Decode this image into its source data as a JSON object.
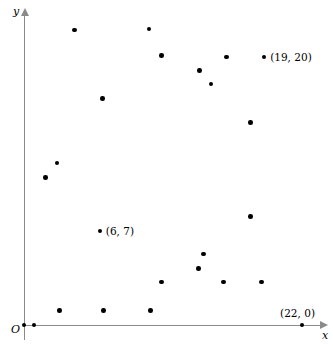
{
  "chart_data": {
    "type": "scatter",
    "title": "",
    "xlabel": "x",
    "ylabel": "y",
    "origin_label": "O",
    "grid": false,
    "legend": "none",
    "xlim": [
      0,
      23.6
    ],
    "ylim": [
      0,
      23.2
    ],
    "marker_color": "#000000",
    "axis_color": "#8a8a8a",
    "points": [
      {
        "x": 0,
        "y": 0,
        "label": ""
      },
      {
        "x": 0.8,
        "y": 0,
        "label": ""
      },
      {
        "x": 2.8,
        "y": 1.1,
        "label": ""
      },
      {
        "x": 2.6,
        "y": 12.1,
        "label": ""
      },
      {
        "x": 1.7,
        "y": 11.0,
        "label": ""
      },
      {
        "x": 6,
        "y": 7,
        "label": "(6, 7)"
      },
      {
        "x": 6.2,
        "y": 16.9,
        "label": ""
      },
      {
        "x": 6.3,
        "y": 1.1,
        "label": ""
      },
      {
        "x": 4.0,
        "y": 22.0,
        "label": ""
      },
      {
        "x": 9.9,
        "y": 22.1,
        "label": ""
      },
      {
        "x": 10.0,
        "y": 1.1,
        "label": ""
      },
      {
        "x": 10.9,
        "y": 3.2,
        "label": ""
      },
      {
        "x": 13.8,
        "y": 4.2,
        "label": ""
      },
      {
        "x": 14.2,
        "y": 5.3,
        "label": ""
      },
      {
        "x": 15.8,
        "y": 3.2,
        "label": ""
      },
      {
        "x": 18.8,
        "y": 3.2,
        "label": ""
      },
      {
        "x": 17.9,
        "y": 8.1,
        "label": ""
      },
      {
        "x": 17.9,
        "y": 15.1,
        "label": ""
      },
      {
        "x": 14.8,
        "y": 18.0,
        "label": ""
      },
      {
        "x": 13.9,
        "y": 19.0,
        "label": ""
      },
      {
        "x": 10.9,
        "y": 20.1,
        "label": ""
      },
      {
        "x": 16.0,
        "y": 20.0,
        "label": ""
      },
      {
        "x": 19,
        "y": 20,
        "label": "(19, 20)"
      },
      {
        "x": 22,
        "y": 0,
        "label": "(22, 0)"
      }
    ]
  }
}
